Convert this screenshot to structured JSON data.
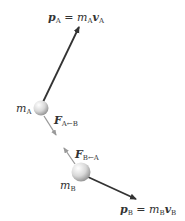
{
  "diagram": {
    "labels": {
      "momentum_a": {
        "symbol": "p",
        "sub": "A",
        "eq": " = ",
        "m": "m",
        "m_sub": "A",
        "v": "v",
        "v_sub": "A"
      },
      "momentum_b": {
        "symbol": "p",
        "sub": "B",
        "eq": " = ",
        "m": "m",
        "m_sub": "B",
        "v": "v",
        "v_sub": "B"
      },
      "mass_a": {
        "m": "m",
        "sub": "A"
      },
      "mass_b": {
        "m": "m",
        "sub": "B"
      },
      "force_a_on_b": {
        "F": "F",
        "sub": "A←B"
      },
      "force_b_on_a": {
        "F": "F",
        "sub": "B←A"
      }
    },
    "colors": {
      "arrow_dark": "#333333",
      "arrow_light": "#999999",
      "ball": "#dcdcdc"
    }
  }
}
